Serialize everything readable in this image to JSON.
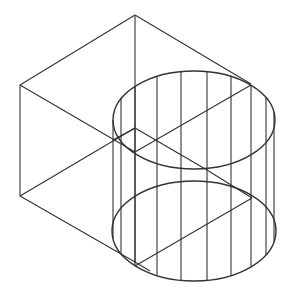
{
  "figure": {
    "stroke_color": "#333333",
    "background": "#ffffff"
  },
  "box": {
    "top_vertex": [
      135,
      15
    ],
    "left_top": [
      20,
      85
    ],
    "left_bottom": [
      20,
      196
    ],
    "inner_vertex": [
      135,
      128
    ],
    "top_right": [
      251,
      84
    ]
  },
  "cylinder": {
    "top_ellipse": {
      "cx": 194,
      "cy": 120,
      "rx": 81,
      "ry": 49
    },
    "bottom_ellipse": {
      "cx": 194,
      "cy": 231,
      "rx": 82,
      "ry": 50
    },
    "vertical_lines_x": [
      113,
      121,
      135,
      157,
      181,
      207,
      231,
      251,
      266,
      274
    ]
  }
}
